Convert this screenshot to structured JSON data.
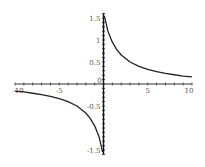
{
  "chart_data": {
    "type": "line",
    "title": "",
    "xlabel": "",
    "ylabel": "",
    "xlim": [
      -10,
      10
    ],
    "ylim": [
      -1.5,
      1.5
    ],
    "grid": false,
    "legend": null,
    "x_ticks": [
      "-10",
      "-5",
      "0",
      "5",
      "10"
    ],
    "y_ticks": [
      "1.5",
      "1",
      "0.5",
      "-0.5",
      "-1.5"
    ],
    "series": [
      {
        "name": "f(x)",
        "color": "#222222",
        "x": [
          0.1,
          0.5,
          1,
          1.5,
          2,
          3,
          4,
          5,
          6,
          7,
          8,
          9,
          10
        ],
        "y": [
          1.55,
          1.2,
          0.95,
          0.78,
          0.66,
          0.5,
          0.4,
          0.33,
          0.28,
          0.24,
          0.21,
          0.18,
          0.16
        ]
      },
      {
        "name": "f(x) negative branch",
        "color": "#222222",
        "x": [
          -10,
          -9,
          -8,
          -7,
          -6,
          -5,
          -4,
          -3,
          -2,
          -1.5,
          -1,
          -0.5,
          -0.1
        ],
        "y": [
          -0.16,
          -0.18,
          -0.21,
          -0.24,
          -0.28,
          -0.33,
          -0.4,
          -0.5,
          -0.66,
          -0.78,
          -0.95,
          -1.2,
          -1.55
        ]
      }
    ]
  }
}
